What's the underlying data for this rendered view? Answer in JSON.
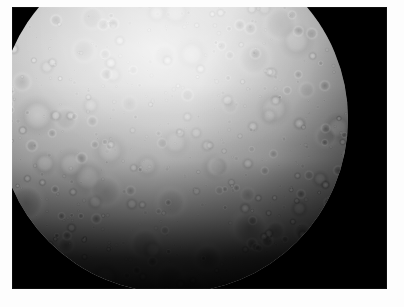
{
  "image": {
    "subject": "Mercury",
    "description": "Grayscale spacecraft photograph of the heavily cratered planet Mercury",
    "alt_text": "Mercury full-disk mosaic, heavily cratered grey surface on black space background",
    "mode": "grayscale",
    "background_color": "#000000",
    "border_color": "#ffffff",
    "frame": {
      "left": 12,
      "top": 7,
      "width": 375,
      "height": 282
    },
    "disk": {
      "center_x": 161,
      "center_y": 112,
      "radius": 175,
      "cropped_at_top": true,
      "terminator_edge": "bottom"
    },
    "features": [
      {
        "name": "data-gap-notch",
        "label": "Missing data strip at top limb"
      },
      {
        "name": "bright-ray-crater",
        "label": "Bright ray crater system"
      },
      {
        "name": "cratered-highlands",
        "label": "Heavily cratered highland terrain"
      },
      {
        "name": "terminator-shadow",
        "label": "Shadowed limb / terminator"
      }
    ]
  }
}
